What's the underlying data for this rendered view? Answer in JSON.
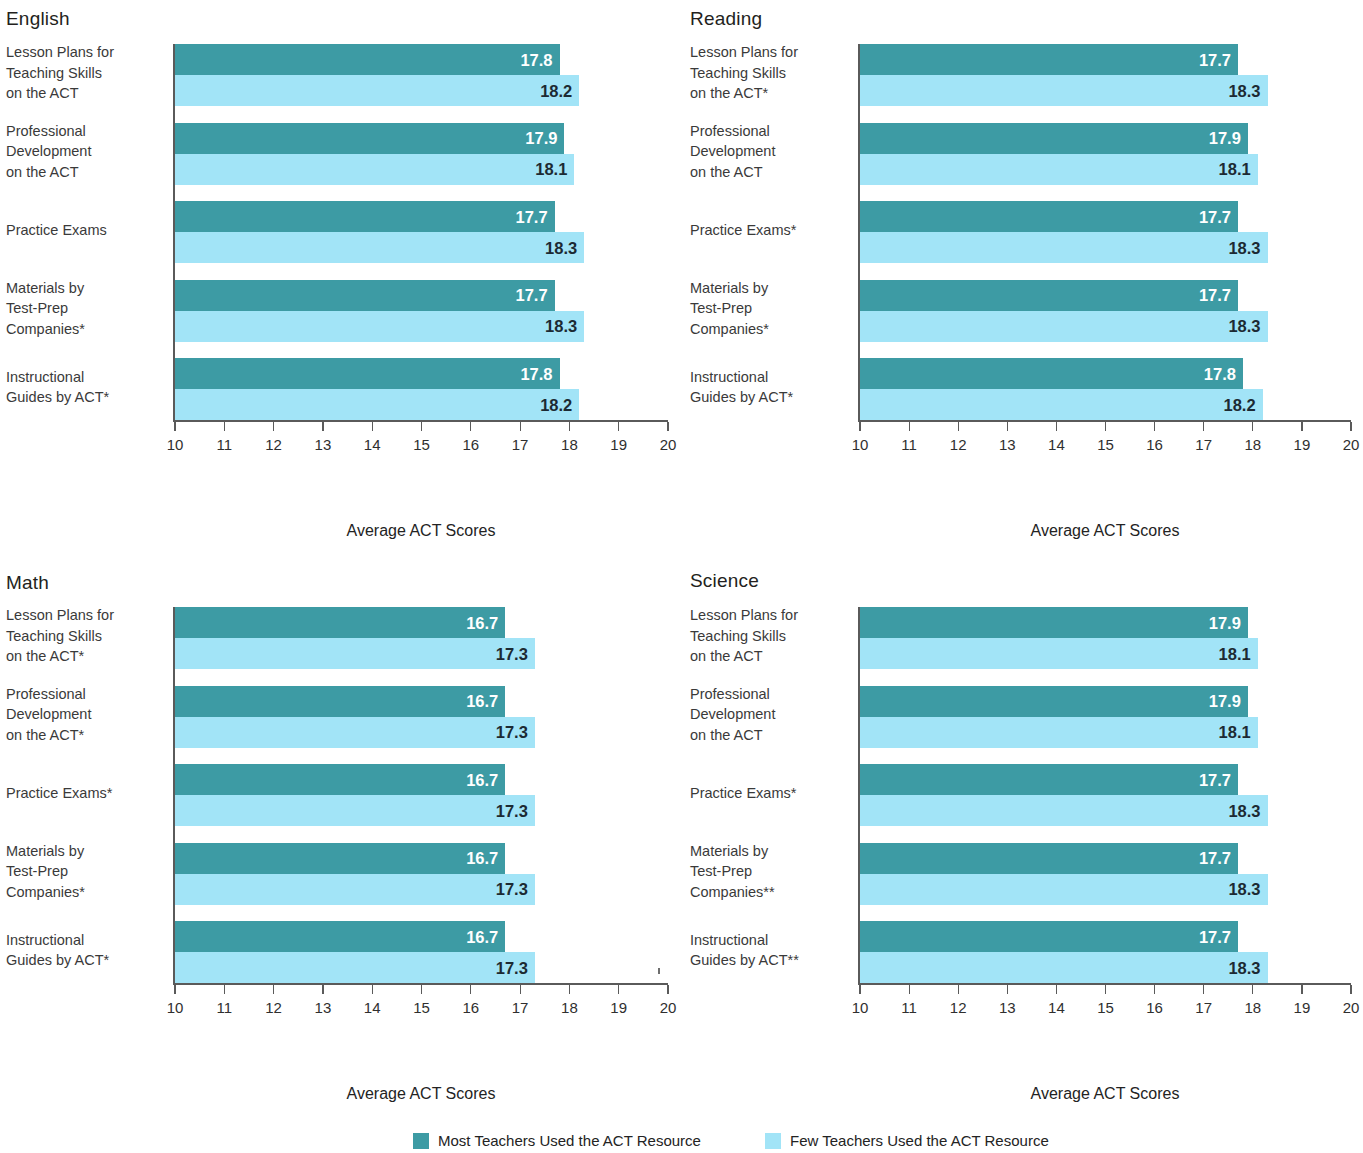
{
  "figure": {
    "x_axis_title": "Average ACT Scores",
    "x_ticks": [
      "10",
      "11",
      "12",
      "13",
      "14",
      "15",
      "16",
      "17",
      "18",
      "19",
      "20"
    ],
    "x_min": 10,
    "x_max": 20,
    "colors": {
      "most_teachers": "#3d9ba4",
      "few_teachers": "#a2e4f7",
      "axis": "#5a5a5a",
      "background": "#ffffff"
    }
  },
  "legend": {
    "items": [
      {
        "label": "Most Teachers Used the ACT Resource",
        "color_key": "most_teachers"
      },
      {
        "label": "Few Teachers Used the ACT Resource",
        "color_key": "few_teachers"
      }
    ]
  },
  "chart_data": [
    {
      "type": "bar",
      "title": "English",
      "xlabel": "Average ACT Scores",
      "ylabel": "",
      "xlim": [
        10,
        20
      ],
      "grid": false,
      "legend_position": "bottom",
      "orientation": "horizontal",
      "categories": [
        "Lesson Plans for\nTeaching Skills\non the ACT",
        "Professional\nDevelopment\non the ACT",
        "Practice Exams",
        "Materials by\nTest-Prep\nCompanies*",
        "Instructional\nGuides by ACT*"
      ],
      "series": [
        {
          "name": "Most Teachers Used the ACT Resource",
          "values": [
            17.8,
            17.9,
            17.7,
            17.7,
            17.8
          ]
        },
        {
          "name": "Few Teachers Used the ACT Resource",
          "values": [
            18.2,
            18.1,
            18.3,
            18.3,
            18.2
          ]
        }
      ]
    },
    {
      "type": "bar",
      "title": "Reading",
      "xlabel": "Average ACT Scores",
      "ylabel": "",
      "xlim": [
        10,
        20
      ],
      "grid": false,
      "legend_position": "bottom",
      "orientation": "horizontal",
      "categories": [
        "Lesson Plans for\nTeaching Skills\non the ACT*",
        "Professional\nDevelopment\non the ACT",
        "Practice Exams*",
        "Materials by\nTest-Prep\nCompanies*",
        "Instructional\nGuides by ACT*"
      ],
      "series": [
        {
          "name": "Most Teachers Used the ACT Resource",
          "values": [
            17.7,
            17.9,
            17.7,
            17.7,
            17.8
          ]
        },
        {
          "name": "Few Teachers Used the ACT Resource",
          "values": [
            18.3,
            18.1,
            18.3,
            18.3,
            18.2
          ]
        }
      ]
    },
    {
      "type": "bar",
      "title": "Math",
      "xlabel": "Average ACT Scores",
      "ylabel": "",
      "xlim": [
        10,
        20
      ],
      "grid": false,
      "legend_position": "bottom",
      "orientation": "horizontal",
      "categories": [
        "Lesson Plans for\nTeaching Skills\non the ACT*",
        "Professional\nDevelopment\non the ACT*",
        "Practice Exams*",
        "Materials by\nTest-Prep\nCompanies*",
        "Instructional\nGuides by ACT*"
      ],
      "series": [
        {
          "name": "Most Teachers Used the ACT Resource",
          "values": [
            16.7,
            16.7,
            16.7,
            16.7,
            16.7
          ]
        },
        {
          "name": "Few Teachers Used the ACT Resource",
          "values": [
            17.3,
            17.3,
            17.3,
            17.3,
            17.3
          ]
        }
      ]
    },
    {
      "type": "bar",
      "title": "Science",
      "xlabel": "Average ACT Scores",
      "ylabel": "",
      "xlim": [
        10,
        20
      ],
      "grid": false,
      "legend_position": "bottom",
      "orientation": "horizontal",
      "categories": [
        "Lesson Plans for\nTeaching Skills\non the ACT",
        "Professional\nDevelopment\non the ACT",
        "Practice Exams*",
        "Materials by\nTest-Prep\nCompanies**",
        "Instructional\nGuides by ACT**"
      ],
      "series": [
        {
          "name": "Most Teachers Used the ACT Resource",
          "values": [
            17.9,
            17.9,
            17.7,
            17.7,
            17.7
          ]
        },
        {
          "name": "Few Teachers Used the ACT Resource",
          "values": [
            18.1,
            18.1,
            18.3,
            18.3,
            18.3
          ]
        }
      ]
    }
  ]
}
